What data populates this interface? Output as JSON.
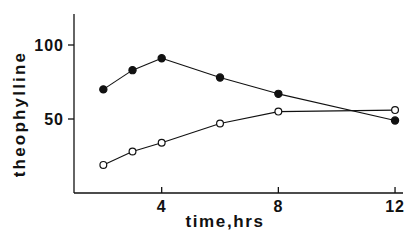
{
  "chart_data": {
    "type": "line",
    "title": "",
    "xlabel": "time,hrs",
    "ylabel": "theophylline",
    "xlim": [
      1,
      12.3
    ],
    "ylim": [
      0,
      121
    ],
    "x_ticks": [
      4,
      8,
      12
    ],
    "x_tick_labels": [
      "4",
      "8",
      "12"
    ],
    "y_ticks": [
      50,
      100
    ],
    "y_tick_labels": [
      "50",
      "100"
    ],
    "grid": false,
    "legend": null,
    "series": [
      {
        "name": "filled circles",
        "marker": "filled-circle",
        "x": [
          2,
          3,
          4,
          6,
          8,
          12
        ],
        "values": [
          70,
          83,
          91,
          78,
          67,
          49
        ]
      },
      {
        "name": "open circles",
        "marker": "open-circle",
        "x": [
          2,
          3,
          4,
          6,
          8,
          12
        ],
        "values": [
          19,
          28,
          34,
          47,
          55,
          56
        ]
      }
    ]
  },
  "colors": {
    "ink": "#111111",
    "background": "#ffffff"
  }
}
